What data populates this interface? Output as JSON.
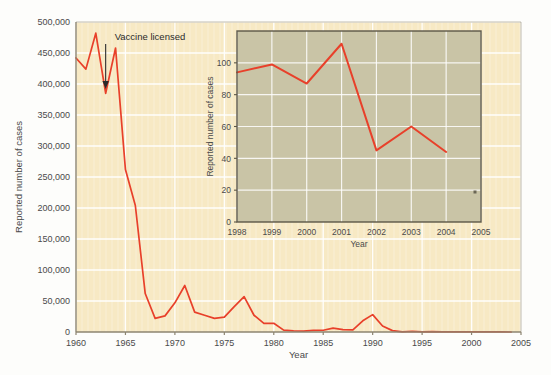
{
  "figure": {
    "background_color": "#fdfdfb",
    "main_plot_bg": "#f7e9c4",
    "inset_plot_bg": "#c9c4a6",
    "line_color": "#e8402a",
    "grid_color": "#ffffff",
    "axis_color": "#8c8470",
    "text_color": "#4a4a4a"
  },
  "annotation": {
    "label": "Vaccine licensed",
    "year": 1963
  },
  "chart_data": {
    "type": "line",
    "title": "",
    "xlabel": "Year",
    "ylabel": "Reported number of cases",
    "xlim": [
      1960,
      2005
    ],
    "ylim": [
      0,
      500000
    ],
    "grid": true,
    "legend": "none",
    "xticks": [
      1960,
      1965,
      1970,
      1975,
      1980,
      1985,
      1990,
      1995,
      2000,
      2005
    ],
    "xtick_labels": [
      "1960",
      "1965",
      "1970",
      "1975",
      "1980",
      "1985",
      "1990",
      "1995",
      "2000",
      "2005"
    ],
    "yticks": [
      0,
      50000,
      100000,
      150000,
      200000,
      250000,
      300000,
      350000,
      400000,
      450000,
      500000
    ],
    "ytick_labels": [
      "0",
      "50,000",
      "100,000",
      "150,000",
      "200,000",
      "250,000",
      "300,000",
      "350,000",
      "400,000",
      "450,000",
      "500,000"
    ],
    "x": [
      1960,
      1961,
      1962,
      1963,
      1964,
      1965,
      1966,
      1967,
      1968,
      1969,
      1970,
      1971,
      1972,
      1973,
      1974,
      1975,
      1976,
      1977,
      1978,
      1979,
      1980,
      1981,
      1982,
      1983,
      1984,
      1985,
      1986,
      1987,
      1988,
      1989,
      1990,
      1991,
      1992,
      1993,
      1994,
      1995,
      1996,
      1997,
      1998,
      1999,
      2000,
      2001,
      2002,
      2003,
      2004
    ],
    "values": [
      442000,
      424000,
      482000,
      385000,
      458000,
      262000,
      204000,
      62000,
      22000,
      26000,
      47000,
      75000,
      32000,
      27000,
      22000,
      24000,
      41000,
      57000,
      27000,
      14000,
      14000,
      3000,
      1700,
      1500,
      2600,
      2800,
      6300,
      3700,
      3400,
      18000,
      28000,
      9600,
      2200,
      312,
      963,
      309,
      508,
      138,
      100,
      100,
      86,
      116,
      44,
      56,
      37
    ]
  },
  "inset_chart_data": {
    "type": "line",
    "title": "",
    "xlabel": "Year",
    "ylabel": "Reported number of cases",
    "xlim": [
      1998,
      2005
    ],
    "ylim": [
      0,
      120
    ],
    "grid": true,
    "legend": "none",
    "xticks": [
      1998,
      1999,
      2000,
      2001,
      2002,
      2003,
      2004,
      2005
    ],
    "xtick_labels": [
      "1998",
      "1999",
      "2000",
      "2001",
      "2002",
      "2003",
      "2004",
      "2005"
    ],
    "yticks": [
      0,
      20,
      40,
      60,
      80,
      100
    ],
    "ytick_labels": [
      "0",
      "20",
      "40",
      "60",
      "80",
      "100"
    ],
    "x": [
      1998,
      1999,
      2000,
      2001,
      2002,
      2003,
      2004
    ],
    "values": [
      94,
      99,
      87,
      112,
      45,
      60,
      44
    ]
  }
}
